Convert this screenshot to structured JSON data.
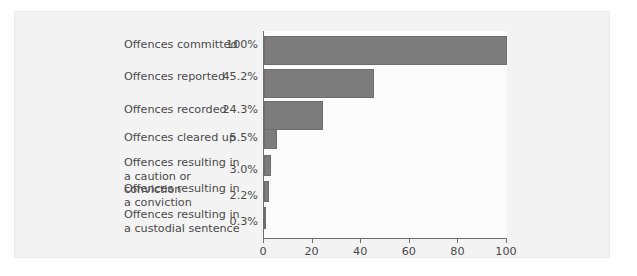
{
  "chart_data": {
    "type": "bar",
    "orientation": "horizontal",
    "title": "",
    "subtitle": "",
    "xlabel": "",
    "ylabel": "",
    "xlim": [
      0,
      100
    ],
    "xticks": [
      0,
      20,
      40,
      60,
      80,
      100
    ],
    "xtick_labels": [
      "0",
      "20",
      "40",
      "60",
      "80",
      "100"
    ],
    "grid": false,
    "legend": false,
    "bar_color": "#7c7c7c",
    "text_color": "#4a4a4a",
    "panel_color": "#f3f3f3",
    "plot_color": "#fbfbfb",
    "categories": [
      "Offences committed",
      "Offences reported",
      "Offences recorded",
      "Offences cleared up",
      "Offences resulting in\na caution or conviction",
      "Offences resulting in\na conviction",
      "Offences resulting in\na custodial sentence"
    ],
    "values": [
      100,
      45.2,
      24.3,
      5.5,
      3.0,
      2.2,
      0.3
    ],
    "value_labels": [
      "100%",
      "45.2%",
      "24.3%",
      "5.5%",
      "3.0%",
      "2.2%",
      "0.3%"
    ]
  },
  "rows": [
    {
      "label": "Offences committed",
      "value_label": "100%",
      "value": 100,
      "label_top": 38,
      "value_top": 38,
      "bar_top": 36,
      "bar_height": 29
    },
    {
      "label": "Offences reported",
      "value_label": "45.2%",
      "value": 45.2,
      "label_top": 70,
      "value_top": 70,
      "bar_top": 69,
      "bar_height": 29
    },
    {
      "label": "Offences recorded",
      "value_label": "24.3%",
      "value": 24.3,
      "label_top": 103,
      "value_top": 103,
      "bar_top": 101,
      "bar_height": 29
    },
    {
      "label": "Offences cleared up",
      "value_label": "5.5%",
      "value": 5.5,
      "label_top": 131,
      "value_top": 131,
      "bar_top": 129,
      "bar_height": 20
    },
    {
      "label": "Offences resulting in\na caution or conviction",
      "value_label": "3.0%",
      "value": 3.0,
      "label_top": 156,
      "value_top": 163,
      "bar_top": 155,
      "bar_height": 21
    },
    {
      "label": "Offences resulting in\na conviction",
      "value_label": "2.2%",
      "value": 2.2,
      "label_top": 182,
      "value_top": 189,
      "bar_top": 181,
      "bar_height": 21
    },
    {
      "label": "Offences resulting in\na custodial sentence",
      "value_label": "0.3%",
      "value": 0.3,
      "label_top": 208,
      "value_top": 215,
      "bar_top": 207,
      "bar_height": 22
    }
  ],
  "axis": {
    "ticks": [
      {
        "label": "0",
        "value": 0
      },
      {
        "label": "20",
        "value": 20
      },
      {
        "label": "40",
        "value": 40
      },
      {
        "label": "60",
        "value": 60
      },
      {
        "label": "80",
        "value": 80
      },
      {
        "label": "100",
        "value": 100
      }
    ]
  }
}
